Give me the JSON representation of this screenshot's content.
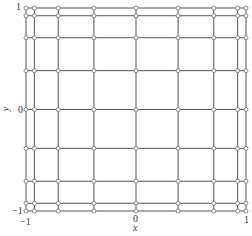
{
  "chart_data": {
    "type": "scatter",
    "title": "",
    "xlabel": "x",
    "ylabel": "y",
    "xlim": [
      -1,
      1
    ],
    "ylim": [
      -1,
      1
    ],
    "grid": false,
    "legend": null,
    "x_nodes": [
      -1,
      -0.9239,
      -0.7071,
      -0.3827,
      0,
      0.3827,
      0.7071,
      0.9239,
      1
    ],
    "y_nodes": [
      -1,
      -0.9239,
      -0.7071,
      -0.3827,
      0,
      0.3827,
      0.7071,
      0.9239,
      1
    ],
    "x_tick_labels": [
      "-1",
      "0",
      "1"
    ],
    "y_tick_labels": [
      "-1",
      "0",
      "1"
    ],
    "line_color": "#555555",
    "marker_color": "#777777"
  },
  "axes": {
    "x_label": "x",
    "y_label": "y",
    "x_ticks": [
      {
        "value": -1,
        "label": "−1"
      },
      {
        "value": 0,
        "label": "0"
      },
      {
        "value": 1,
        "label": "1"
      }
    ],
    "y_ticks": [
      {
        "value": -1,
        "label": "−1"
      },
      {
        "value": 0,
        "label": "0"
      },
      {
        "value": 1,
        "label": "1"
      }
    ]
  }
}
